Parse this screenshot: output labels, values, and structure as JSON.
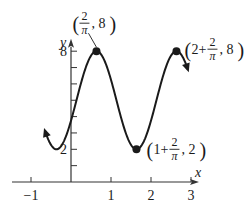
{
  "chart_data": {
    "type": "line",
    "title": "",
    "function": "y = 5 + 3cos(pi*x - 2)",
    "xlabel": "x",
    "ylabel": "y",
    "xlim": [
      -1.05,
      3.2
    ],
    "ylim": [
      0,
      8.4
    ],
    "x_ticks": [
      -1,
      1,
      2,
      3
    ],
    "x_tick_labels": [
      "−1",
      "1",
      "2",
      "3"
    ],
    "y_ticks": [
      1,
      2,
      3,
      4,
      5,
      6,
      7,
      8
    ],
    "y_tick_labels": {
      "2": "2",
      "8": "8"
    },
    "curve_domain": [
      -0.65,
      2.92
    ],
    "arrows_at_ends": true,
    "grid": false,
    "points": [
      {
        "x": 0.6366,
        "y": 8,
        "label_parts": [
          "",
          "2",
          "π",
          ", 8"
        ],
        "label": "(2/π, 8)"
      },
      {
        "x": 1.6366,
        "y": 2,
        "label_parts": [
          "1+",
          "2",
          "π",
          ", 2"
        ],
        "label": "(1+2/π, 2)"
      },
      {
        "x": 2.6366,
        "y": 8,
        "label_parts": [
          "2+",
          "2",
          "π",
          ", 8"
        ],
        "label": "(2+2/π, 8)"
      }
    ],
    "colors": {
      "curve": "#1a1a1a",
      "axis": "#333333"
    }
  }
}
